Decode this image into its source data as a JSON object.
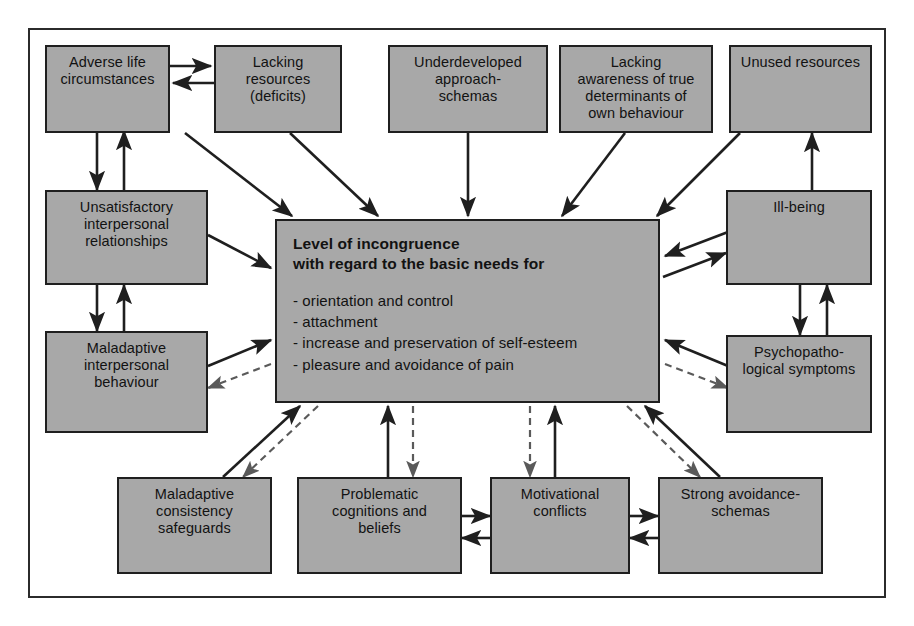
{
  "diagram": {
    "background_color": "#ffffff",
    "box_fill_color": "#a8a8a8",
    "box_border_color": "#1f1f1f",
    "frame_border_color": "#2b2b2b",
    "arrow_color": "#1f1f1f"
  },
  "nodes": {
    "adverse_life": {
      "label": "Adverse life\ncircumstances"
    },
    "lacking_resources": {
      "label": "Lacking resources\n(deficits)"
    },
    "underdeveloped": {
      "label": "Underdeveloped\napproach-\nschemas"
    },
    "lacking_awareness": {
      "label": "Lacking\nawareness of true\ndeterminants of\nown behaviour"
    },
    "unused_resources": {
      "label": "Unused resources"
    },
    "unsatisfactory": {
      "label": "Unsatisfactory\ninterpersonal\nrelationships"
    },
    "maladaptive_behaviour": {
      "label": "Maladaptive\ninterpersonal\nbehaviour"
    },
    "ill_being": {
      "label": "Ill-being"
    },
    "psychopathological": {
      "label": "Psychopatho-\nlogical symptoms"
    },
    "center": {
      "heading": "Level of incongruence\nwith regard to the basic needs for",
      "needs": "- orientation and control\n- attachment\n- increase and preservation of self-esteem\n- pleasure and avoidance of pain",
      "needs_list": [
        "orientation and control",
        "attachment",
        "increase and preservation of self-esteem",
        "pleasure and avoidance of pain"
      ]
    },
    "maladaptive_safeguards": {
      "label": "Maladaptive\nconsistency\nsafeguards"
    },
    "problematic_cognitions": {
      "label": "Problematic\ncognitions and\nbeliefs"
    },
    "motivational_conflicts": {
      "label": "Motivational\nconflicts"
    },
    "strong_avoidance": {
      "label": "Strong avoidance-\nschemas"
    }
  },
  "edges": [
    {
      "from": "adverse_life",
      "to": "lacking_resources",
      "style": "solid",
      "direction": "forward"
    },
    {
      "from": "lacking_resources",
      "to": "adverse_life",
      "style": "solid",
      "direction": "forward"
    },
    {
      "from": "adverse_life",
      "to": "unsatisfactory",
      "style": "solid",
      "direction": "forward"
    },
    {
      "from": "unsatisfactory",
      "to": "adverse_life",
      "style": "solid",
      "direction": "forward"
    },
    {
      "from": "adverse_life",
      "to": "center",
      "style": "solid",
      "direction": "forward"
    },
    {
      "from": "lacking_resources",
      "to": "center",
      "style": "solid",
      "direction": "forward"
    },
    {
      "from": "underdeveloped",
      "to": "center",
      "style": "solid",
      "direction": "forward"
    },
    {
      "from": "lacking_awareness",
      "to": "center",
      "style": "solid",
      "direction": "forward"
    },
    {
      "from": "unused_resources",
      "to": "center",
      "style": "solid",
      "direction": "forward"
    },
    {
      "from": "ill_being",
      "to": "unused_resources",
      "style": "solid",
      "direction": "forward"
    },
    {
      "from": "unsatisfactory",
      "to": "center",
      "style": "solid",
      "direction": "forward"
    },
    {
      "from": "unsatisfactory",
      "to": "maladaptive_behaviour",
      "style": "solid",
      "direction": "forward"
    },
    {
      "from": "maladaptive_behaviour",
      "to": "unsatisfactory",
      "style": "solid",
      "direction": "forward"
    },
    {
      "from": "maladaptive_behaviour",
      "to": "center",
      "style": "solid",
      "direction": "forward"
    },
    {
      "from": "center",
      "to": "maladaptive_behaviour",
      "style": "dashed",
      "direction": "forward"
    },
    {
      "from": "center",
      "to": "ill_being",
      "style": "solid",
      "direction": "forward"
    },
    {
      "from": "ill_being",
      "to": "center",
      "style": "solid",
      "direction": "forward"
    },
    {
      "from": "ill_being",
      "to": "psychopathological",
      "style": "solid",
      "direction": "forward"
    },
    {
      "from": "psychopathological",
      "to": "ill_being",
      "style": "solid",
      "direction": "forward"
    },
    {
      "from": "psychopathological",
      "to": "center",
      "style": "solid",
      "direction": "forward"
    },
    {
      "from": "center",
      "to": "psychopathological",
      "style": "dashed",
      "direction": "forward"
    },
    {
      "from": "maladaptive_safeguards",
      "to": "center",
      "style": "solid",
      "direction": "forward"
    },
    {
      "from": "center",
      "to": "maladaptive_safeguards",
      "style": "dashed",
      "direction": "forward"
    },
    {
      "from": "problematic_cognitions",
      "to": "center",
      "style": "solid",
      "direction": "forward"
    },
    {
      "from": "center",
      "to": "problematic_cognitions",
      "style": "dashed",
      "direction": "forward"
    },
    {
      "from": "motivational_conflicts",
      "to": "center",
      "style": "solid",
      "direction": "forward"
    },
    {
      "from": "center",
      "to": "motivational_conflicts",
      "style": "dashed",
      "direction": "forward"
    },
    {
      "from": "strong_avoidance",
      "to": "center",
      "style": "solid",
      "direction": "forward"
    },
    {
      "from": "center",
      "to": "strong_avoidance",
      "style": "dashed",
      "direction": "forward"
    },
    {
      "from": "problematic_cognitions",
      "to": "motivational_conflicts",
      "style": "solid",
      "direction": "forward"
    },
    {
      "from": "motivational_conflicts",
      "to": "problematic_cognitions",
      "style": "solid",
      "direction": "forward"
    },
    {
      "from": "motivational_conflicts",
      "to": "strong_avoidance",
      "style": "solid",
      "direction": "forward"
    },
    {
      "from": "strong_avoidance",
      "to": "motivational_conflicts",
      "style": "solid",
      "direction": "forward"
    }
  ]
}
